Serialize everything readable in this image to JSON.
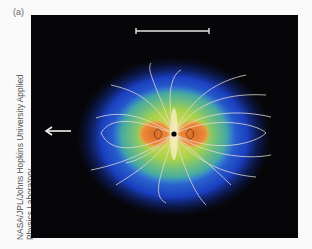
{
  "figure": {
    "panel_label": "(a)",
    "credit_line1": "NASA/JPL/Johns Hopkins University Applied",
    "credit_line2": "Physics Laboratory",
    "background_color": "#060608",
    "colors": {
      "outer": "#1a3fbf",
      "mid": "#3fa0e0",
      "inner": "#9ed24a",
      "core": "#e87a30",
      "field_lines": "#e9dcd6",
      "planet": "#000000"
    },
    "scale_bar": {
      "x1": 105,
      "x2": 178,
      "y": 16
    },
    "arrow": {
      "direction": "left",
      "x1": 40,
      "x2": 15,
      "y": 116
    },
    "planet_center": {
      "x": 143,
      "y": 119
    }
  }
}
